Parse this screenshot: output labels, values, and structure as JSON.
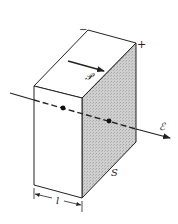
{
  "figure": {
    "labels": {
      "negative_sign": "−",
      "positive_sign": "+",
      "polarization_symbol": "𝒫",
      "field_symbol": "ℰ",
      "surface_label": "S",
      "thickness_label": "l"
    },
    "colors": {
      "stroke": "#222222",
      "shaded_face": "#c8c8c8",
      "background": "#ffffff"
    }
  }
}
